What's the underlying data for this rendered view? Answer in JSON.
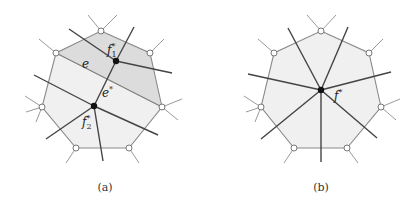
{
  "colors": {
    "background": "#ffffff",
    "face_light": "#f0f0f0",
    "face_dark": "#dcdcdc",
    "polygon_edge": "#8a8a8a",
    "dual_edge": "#444444",
    "dual_vertex": "#111111",
    "open_vertex_fill": "#ffffff"
  },
  "panels": [
    {
      "caption": "(a)",
      "description": "Heptagonal face split by edge e into two faces with dual vertices f1* and f2*; dual edge e* connects them",
      "labels": {
        "f1": "f",
        "f1_sub": "1",
        "f2": "f",
        "f2_sub": "2",
        "star": "*",
        "e": "e",
        "e_star": "e",
        "e_star_sup": "*"
      }
    },
    {
      "caption": "(b)",
      "description": "Single heptagonal face with one dual vertex f* and seven dual edges radiating through the polygon sides",
      "labels": {
        "f": "f",
        "star": "*"
      }
    }
  ]
}
